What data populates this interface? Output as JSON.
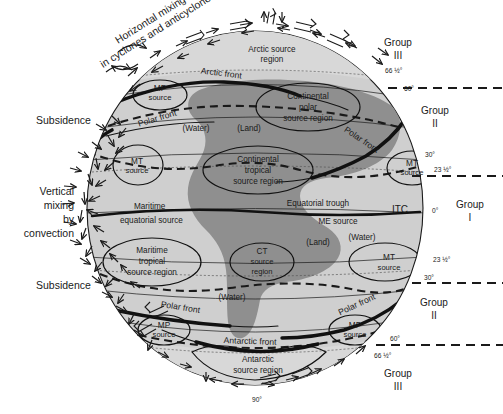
{
  "figure": {
    "title_annotation_line1": "Horizontal mixing",
    "title_annotation_line2": "in cyclones and anticyclones",
    "left_annotations": [
      {
        "id": "subsidence-top",
        "text": "Subsidence"
      },
      {
        "id": "vertical-mixing",
        "line1": "Vertical",
        "line2": "mixing",
        "line3": "by",
        "line4": "convection"
      },
      {
        "id": "subsidence-bottom",
        "text": "Subsidence"
      }
    ],
    "groups": [
      {
        "id": "group-iii-north",
        "line1": "Group",
        "line2": "III"
      },
      {
        "id": "group-ii-north",
        "line1": "Group",
        "line2": "II"
      },
      {
        "id": "group-i",
        "line1": "Group",
        "line2": "I"
      },
      {
        "id": "group-ii-south",
        "line1": "Group",
        "line2": "II"
      },
      {
        "id": "group-iii-south",
        "line1": "Group",
        "line2": "III"
      }
    ],
    "latitudes": [
      {
        "id": "lat-66n",
        "label": "66 ½°"
      },
      {
        "id": "lat-60n",
        "label": "60°"
      },
      {
        "id": "lat-30n",
        "label": "30°"
      },
      {
        "id": "lat-23n",
        "label": "23 ½°"
      },
      {
        "id": "lat-0",
        "label": "0°"
      },
      {
        "id": "lat-23s",
        "label": "23 ½°"
      },
      {
        "id": "lat-30s",
        "label": "30°"
      },
      {
        "id": "lat-60s",
        "label": "60°"
      },
      {
        "id": "lat-66s",
        "label": "66 ½°"
      },
      {
        "id": "lat-90s",
        "label": "90°"
      }
    ],
    "source_regions": [
      {
        "id": "arctic-source-region",
        "line1": "Arctic source",
        "line2": "region"
      },
      {
        "id": "mp-source-nw",
        "line1": "MP",
        "line2": "source"
      },
      {
        "id": "continental-polar-source-region",
        "line1": "Continental",
        "line2": "polar",
        "line3": "source region"
      },
      {
        "id": "mt-source-nw",
        "line1": "MT",
        "line2": "source"
      },
      {
        "id": "continental-tropical-source-region",
        "line1": "Continental",
        "line2": "tropical",
        "line3": "source region"
      },
      {
        "id": "mt-source-ne",
        "line1": "MT",
        "line2": "source"
      },
      {
        "id": "maritime-equatorial-source",
        "line1": "Maritime",
        "line2": "equatorial source"
      },
      {
        "id": "me-source",
        "text": "ME source"
      },
      {
        "id": "maritime-tropical-source-region",
        "line1": "Maritime",
        "line2": "tropical",
        "line3": "source region"
      },
      {
        "id": "ct-source-region",
        "line1": "CT",
        "line2": "source",
        "line3": "region"
      },
      {
        "id": "mt-source-se",
        "line1": "MT",
        "line2": "source"
      },
      {
        "id": "mp-source-sw",
        "line1": "MP",
        "line2": "source"
      },
      {
        "id": "mp-source-se",
        "line1": "MP",
        "line2": "source"
      },
      {
        "id": "antarctic-source-region",
        "line1": "Antarctic",
        "line2": "source region"
      }
    ],
    "fronts": [
      {
        "id": "arctic-front",
        "label": "Arctic   front"
      },
      {
        "id": "polar-front-nw",
        "label": "Polar   front"
      },
      {
        "id": "polar-front-ne",
        "label": "Polar   front"
      },
      {
        "id": "polar-front-sw",
        "label": "Polar   front"
      },
      {
        "id": "polar-front-se",
        "label": "Polar   front"
      },
      {
        "id": "antarctic-front",
        "label": "Antarctic    front"
      }
    ],
    "surface_labels": [
      {
        "id": "water-nw",
        "text": "(Water)"
      },
      {
        "id": "land-north",
        "text": "(Land)"
      },
      {
        "id": "land-south",
        "text": "(Land)"
      },
      {
        "id": "water-ne",
        "text": "(Water)"
      },
      {
        "id": "water-sw",
        "text": "(Water)"
      }
    ],
    "trough": {
      "id": "equatorial-trough",
      "text": "Equatorial trough"
    },
    "itc": {
      "id": "itc",
      "text": "ITC"
    },
    "colors": {
      "ocean": "#cfcfcf",
      "land": "#8f8f8f",
      "polar_cap": "#d6d6d6",
      "line": "#1a1a1a",
      "background": "#ffffff"
    }
  }
}
